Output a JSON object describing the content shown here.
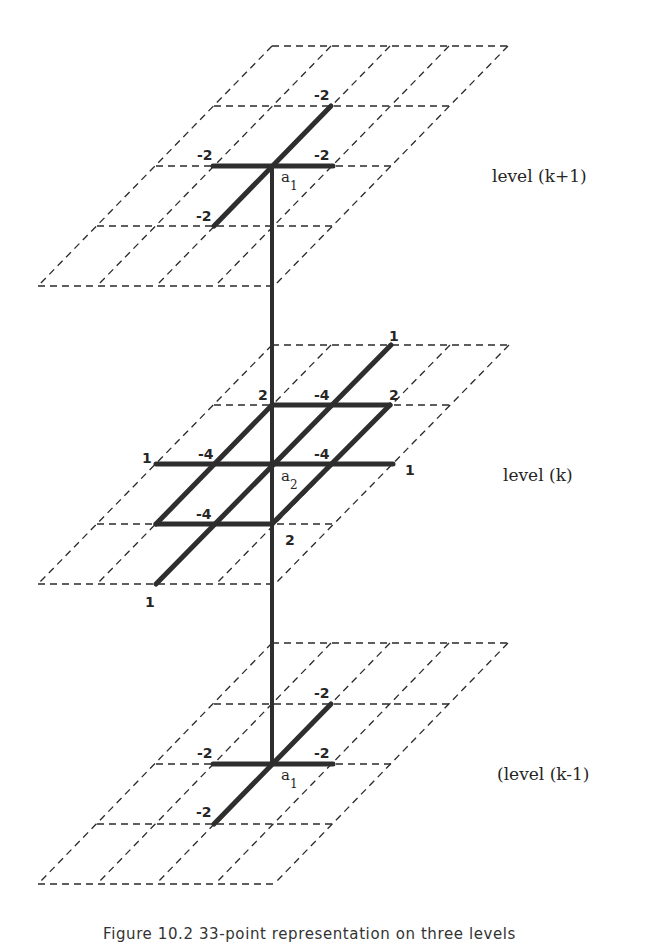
{
  "diagram": {
    "caption": "Figure 10.2   33-point representation on three levels",
    "levels": [
      {
        "name": "level (k+1)",
        "node_label": "a",
        "node_index": "1",
        "weights": {
          "top": "-2",
          "left": "-2",
          "right": "-2",
          "bottom": "-2"
        }
      },
      {
        "name": "level (k)",
        "node_label": "a",
        "node_index": "2",
        "weights": {
          "top_far": "1",
          "top_left": "2",
          "top_mid": "-4",
          "top_right": "2",
          "mid_far_left": "1",
          "mid_left": "-4",
          "mid_right": "-4",
          "mid_far_right": "1",
          "bottom_mid": "-4",
          "bottom_right": "2",
          "bottom_far": "1"
        }
      },
      {
        "name": "(level (k-1)",
        "node_label": "a",
        "node_index": "1",
        "weights": {
          "top": "-2",
          "left": "-2",
          "right": "-2",
          "bottom": "-2"
        }
      }
    ],
    "colors": {
      "lines": "#2e2e2e",
      "background": "#ffffff"
    }
  }
}
